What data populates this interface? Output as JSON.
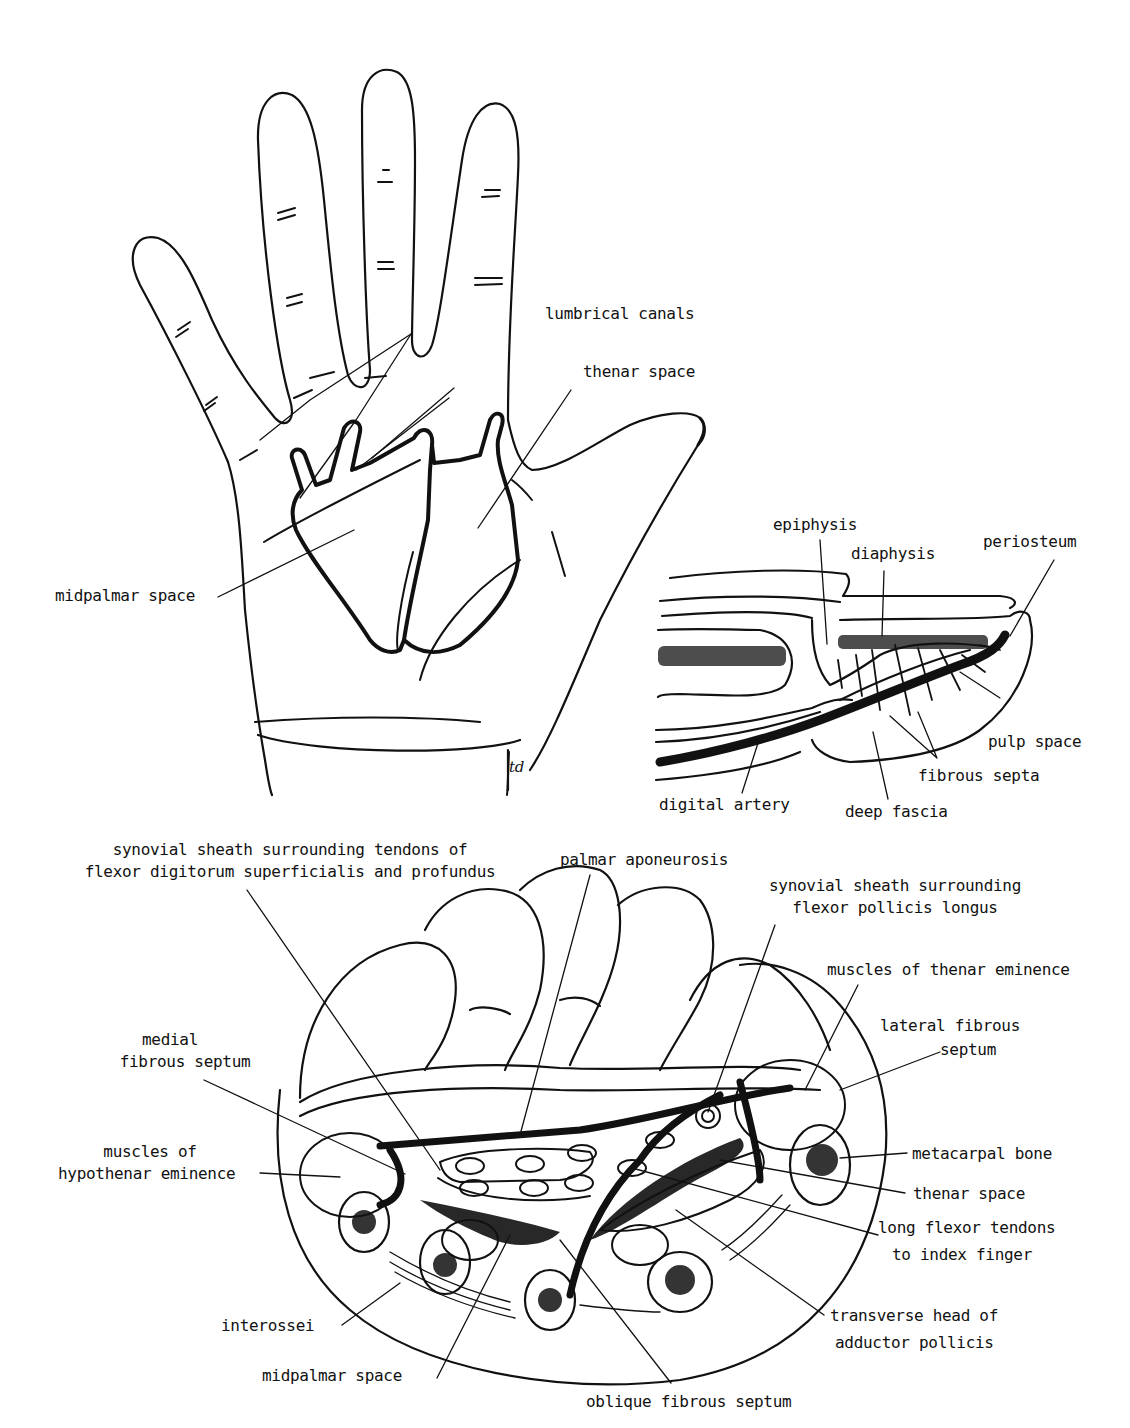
{
  "figure_a": {
    "title": "palmar surface of hand",
    "labels": {
      "lumbrical_canals": "lumbrical canals",
      "thenar_space": "thenar space",
      "midpalmar_space": "midpalmar space"
    },
    "signature": "td"
  },
  "figure_b": {
    "title": "fingertip sagittal section",
    "labels": {
      "epiphysis": "epiphysis",
      "diaphysis": "diaphysis",
      "periosteum": "periosteum",
      "pulp_space": "pulp space",
      "fibrous_septa": "fibrous septa",
      "digital_artery": "digital artery",
      "deep_fascia": "deep fascia"
    }
  },
  "figure_c": {
    "title": "cross section of palm",
    "labels": {
      "synovial_fds_1": "synovial sheath surrounding tendons of",
      "synovial_fds_2": "flexor digitorum superficialis and profundus",
      "palmar_aponeurosis": "palmar aponeurosis",
      "synovial_fpl_1": "synovial sheath surrounding",
      "synovial_fpl_2": "flexor pollicis longus",
      "thenar_muscles": "muscles of thenar eminence",
      "lateral_septum_1": "lateral fibrous",
      "lateral_septum_2": "septum",
      "medial_septum_1": "medial",
      "medial_septum_2": "fibrous septum",
      "hypothenar_1": "muscles of",
      "hypothenar_2": "hypothenar eminence",
      "metacarpal_bone": "metacarpal bone",
      "thenar_space": "thenar space",
      "long_flexor_1": "long flexor tendons",
      "long_flexor_2": "to index finger",
      "transverse_head_1": "transverse head of",
      "transverse_head_2": "adductor pollicis",
      "interossei": "interossei",
      "midpalmar_space": "midpalmar space",
      "oblique_septum": "oblique fibrous septum"
    }
  }
}
